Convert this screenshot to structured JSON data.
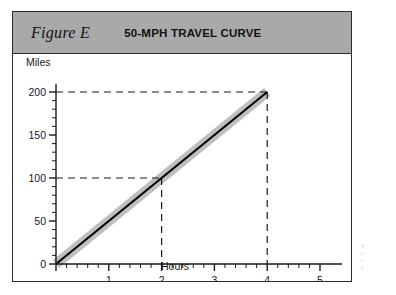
{
  "figure": {
    "label": "Figure E",
    "title": "50-MPH TRAVEL CURVE"
  },
  "axes": {
    "y_caption": "Miles",
    "x_caption": "Hours"
  },
  "colors": {
    "band": "#a9a9a9",
    "frame": "#2b2b2b",
    "line": "#000000",
    "shadow": "#bfbfbf",
    "dashed": "#1a1a1a"
  },
  "margin_notes": [
    "T",
    "c",
    "t",
    "t"
  ],
  "chart_data": {
    "type": "line",
    "title": "50-MPH TRAVEL CURVE",
    "xlabel": "Hours",
    "ylabel": "Miles",
    "xlim": [
      0,
      5
    ],
    "ylim": [
      0,
      200
    ],
    "grid": false,
    "legend": false,
    "x_ticks": [
      0,
      1,
      2,
      3,
      4,
      5
    ],
    "x_tick_labels": [
      "0",
      "1",
      "2",
      "3",
      "4",
      "5"
    ],
    "x_minor_step": 0.2,
    "y_ticks": [
      0,
      50,
      100,
      150,
      200
    ],
    "y_tick_labels": [
      "0",
      "50",
      "100",
      "150",
      "200"
    ],
    "y_minor_step": 10,
    "series": [
      {
        "name": "50 mph travel curve",
        "x": [
          0,
          4
        ],
        "values": [
          0,
          200
        ],
        "style": "solid-black-on-gray-band"
      }
    ],
    "annotations": [
      {
        "type": "dashed-guide",
        "x": 2,
        "y": 100,
        "label": "2 hours = 100 miles"
      },
      {
        "type": "dashed-guide",
        "x": 4,
        "y": 200,
        "label": "4 hours = 200 miles"
      }
    ]
  }
}
